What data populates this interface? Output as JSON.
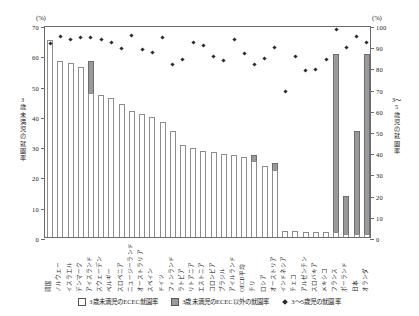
{
  "axis": {
    "unit_left": "(%)",
    "unit_right": "(%)",
    "title_left": "3歳未満児の就園率",
    "title_right": "3〜5歳児の就園率",
    "left_ticks": [
      0,
      10,
      20,
      30,
      40,
      50,
      60,
      70
    ],
    "right_ticks": [
      0,
      10,
      20,
      30,
      40,
      50,
      60,
      70,
      80,
      90,
      100
    ]
  },
  "legend": [
    {
      "key": "ecec",
      "label": "3歳未満児のECEC就園率"
    },
    {
      "key": "other",
      "label": "3歳未満児のECEC以外の就園率"
    },
    {
      "key": "age35",
      "label": "3〜5歳児の就園率"
    }
  ],
  "chart_data": {
    "type": "bar",
    "title": "",
    "xlabel": "",
    "ylabel": "3歳未満児の就園率",
    "ylabel_right": "3〜5歳児の就園率",
    "ylim": [
      0,
      70
    ],
    "ylim_right": [
      0,
      100
    ],
    "grid": false,
    "legend_position": "bottom",
    "categories": [
      "韓国",
      "ノルウェー",
      "イスラエル",
      "デンマーク",
      "アイスランド",
      "スウェーデン",
      "ベルギー",
      "スロベニア",
      "ニュージーランド",
      "オーストラリア",
      "スペイン",
      "ドイツ",
      "フィンランド",
      "ラトビア",
      "リトアニア",
      "エストニア",
      "コロンビア",
      "ブラジル",
      "アイルランド",
      "OECD平均",
      "チリ",
      "ロシア",
      "オーストリア",
      "インドネシア",
      "チェコ",
      "アルゼンチン",
      "スロバキア",
      "メキシコ",
      "フランス",
      "ポーランド",
      "日本",
      "オランダ"
    ],
    "series": [
      {
        "name": "3歳未満児のECEC就園率",
        "values": [
          65.0,
          58.0,
          57.5,
          56.0,
          47.5,
          47.0,
          46.0,
          44.0,
          41.5,
          40.5,
          39.5,
          38.0,
          35.0,
          30.5,
          29.5,
          28.5,
          28.0,
          27.5,
          27.0,
          26.5,
          25.0,
          23.5,
          22.0,
          2.0,
          2.0,
          1.5,
          1.5,
          1.5,
          1.5,
          1.0,
          1.0,
          1.0
        ]
      },
      {
        "name": "3歳未満児のECEC以外の就園率",
        "values": [
          0,
          0,
          0,
          0,
          10.5,
          0,
          0,
          0,
          0,
          0,
          0,
          0,
          0,
          0,
          0,
          0,
          0,
          0,
          0,
          0,
          2.0,
          0,
          2.5,
          0,
          0,
          0,
          0,
          0,
          59.0,
          12.5,
          34.0,
          59.5
        ]
      }
    ],
    "markers": {
      "name": "3〜5歳児の就園率",
      "axis": "right",
      "values": [
        92.0,
        95.5,
        94.0,
        95.0,
        95.0,
        94.0,
        92.5,
        90.0,
        96.0,
        89.5,
        88.0,
        95.0,
        82.5,
        84.5,
        92.5,
        91.5,
        86.0,
        84.0,
        94.0,
        87.5,
        82.5,
        85.0,
        90.5,
        69.5,
        86.0,
        79.5,
        80.0,
        84.5,
        99.0,
        90.5,
        95.5,
        92.5
      ]
    }
  }
}
